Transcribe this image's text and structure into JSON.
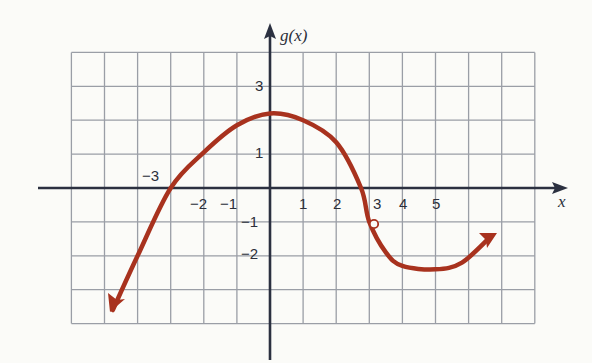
{
  "chart_data": {
    "type": "line",
    "title": "",
    "xlabel": "x",
    "ylabel": "g(x)",
    "xlim": [
      -6,
      8
    ],
    "ylim": [
      -4,
      4
    ],
    "grid": true,
    "x_tick_labels": [
      "-3",
      "-2",
      "-1",
      "1",
      "2",
      "3",
      "4",
      "5"
    ],
    "y_tick_labels": [
      "3",
      "1",
      "-1",
      "-2"
    ],
    "series": [
      {
        "name": "g(x)",
        "color": "#a8321e",
        "x": [
          -4.75,
          -4.0,
          -3.0,
          -2.0,
          -1.0,
          0.0,
          1.0,
          2.0,
          2.75,
          3.0,
          3.5,
          4.0,
          5.0,
          5.8,
          6.7
        ],
        "y": [
          -3.6,
          -2.0,
          0.0,
          1.05,
          1.85,
          2.2,
          2.0,
          1.35,
          0.0,
          -1.0,
          -1.9,
          -2.3,
          -2.4,
          -2.2,
          -1.4
        ],
        "end_arrows": [
          "left",
          "right"
        ],
        "open_points": [
          [
            3,
            -1
          ]
        ]
      }
    ]
  },
  "labels": {
    "y_axis": "g(x)",
    "x_axis": "x",
    "xt_m3": "−3",
    "xt_m2": "−2",
    "xt_m1": "−1",
    "xt_1": "1",
    "xt_2": "2",
    "xt_3": "3",
    "xt_4": "4",
    "xt_5": "5",
    "yt_3": "3",
    "yt_1": "1",
    "yt_m1": "−1",
    "yt_m2": "−2"
  }
}
